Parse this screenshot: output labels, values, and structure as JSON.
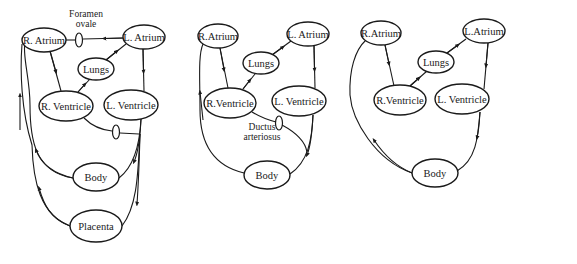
{
  "figure": {
    "colors": {
      "ink": "#1a1a1a",
      "background": "#ffffff"
    }
  },
  "diagrams": [
    {
      "id": "fetal",
      "nodes": {
        "r_atrium": "R. Atrium",
        "l_atrium": "L. Atrium",
        "lungs": "Lungs",
        "r_ventricle": "R. Ventricle",
        "l_ventricle": "L. Ventricle",
        "body": "Body",
        "placenta": "Placenta"
      },
      "annotations": {
        "foramen_line1": "Foramen",
        "foramen_line2": "ovale"
      }
    },
    {
      "id": "transitional",
      "nodes": {
        "r_atrium": "R.Atrium",
        "l_atrium": "L. Atrium",
        "lungs": "Lungs",
        "r_ventricle": "R.Ventricle",
        "l_ventricle": "L. Ventricle",
        "body": "Body"
      },
      "annotations": {
        "ductus_line1": "Ductus",
        "ductus_line2": "arteriosus"
      }
    },
    {
      "id": "adult",
      "nodes": {
        "r_atrium": "R.Atrium",
        "l_atrium": "L.Atrium",
        "lungs": "Lungs",
        "r_ventricle": "R.Ventricle",
        "l_ventricle": "L. Ventricle",
        "body": "Body"
      }
    }
  ]
}
